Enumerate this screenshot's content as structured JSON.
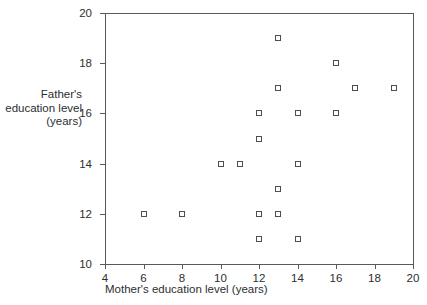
{
  "chart_data": {
    "type": "scatter",
    "title": "",
    "xlabel": "Mother's education level (years)",
    "ylabel_lines": [
      "Father's",
      "education level",
      "(years)"
    ],
    "ylabel": "Father's education level (years)",
    "xlim": [
      4,
      20
    ],
    "ylim": [
      10,
      20
    ],
    "xticks": [
      4,
      6,
      8,
      10,
      12,
      14,
      16,
      18,
      20
    ],
    "yticks": [
      10,
      12,
      14,
      16,
      18,
      20
    ],
    "grid": false,
    "legend": null,
    "marker": "open-square",
    "marker_color": "#4a4f54",
    "axis_color": "#555a5e",
    "points": [
      {
        "x": 6,
        "y": 12
      },
      {
        "x": 8,
        "y": 12
      },
      {
        "x": 10,
        "y": 14
      },
      {
        "x": 11,
        "y": 14
      },
      {
        "x": 12,
        "y": 11
      },
      {
        "x": 12,
        "y": 12
      },
      {
        "x": 12,
        "y": 15
      },
      {
        "x": 12,
        "y": 16
      },
      {
        "x": 13,
        "y": 12
      },
      {
        "x": 13,
        "y": 13
      },
      {
        "x": 13,
        "y": 17
      },
      {
        "x": 13,
        "y": 19
      },
      {
        "x": 14,
        "y": 11
      },
      {
        "x": 14,
        "y": 14
      },
      {
        "x": 14,
        "y": 16
      },
      {
        "x": 16,
        "y": 16
      },
      {
        "x": 16,
        "y": 18
      },
      {
        "x": 17,
        "y": 17
      },
      {
        "x": 19,
        "y": 17
      }
    ]
  }
}
